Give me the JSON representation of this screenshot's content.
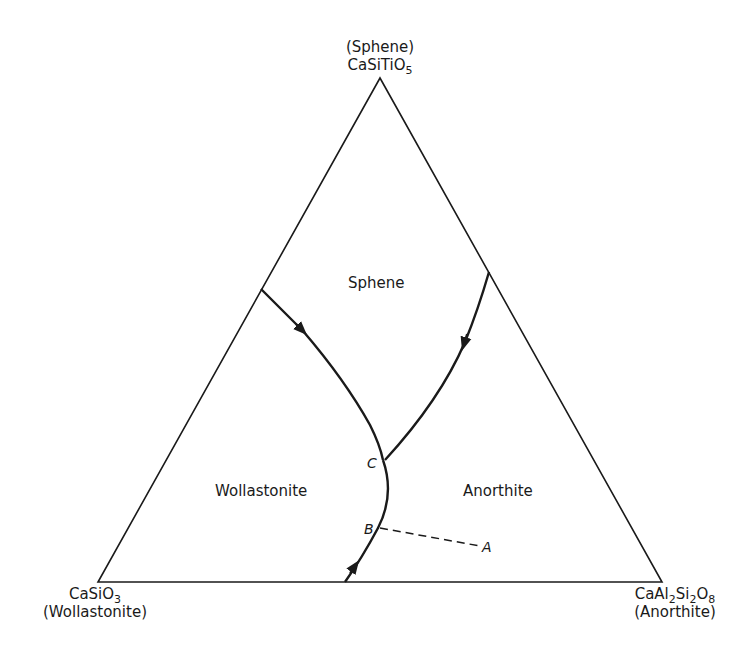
{
  "diagram": {
    "type": "ternary_phase_diagram",
    "vertices": {
      "top": {
        "mineral": "(Sphene)",
        "formula_base": "CaSiTiO",
        "formula_sub": "5"
      },
      "left": {
        "formula_base": "CaSiO",
        "formula_sub": "3",
        "mineral": "(Wollastonite)"
      },
      "right": {
        "f1": "CaAl",
        "s1": "2",
        "f2": "Si",
        "s2": "2",
        "f3": "O",
        "s3": "8",
        "mineral": "(Anorthite)"
      }
    },
    "fields": {
      "sphene": "Sphene",
      "wollastonite": "Wollastonite",
      "anorthite": "Anorthite"
    },
    "points": {
      "A": "A",
      "B": "B",
      "C": "C"
    },
    "colors": {
      "line": "#1a1a1a",
      "background": "#ffffff"
    }
  }
}
